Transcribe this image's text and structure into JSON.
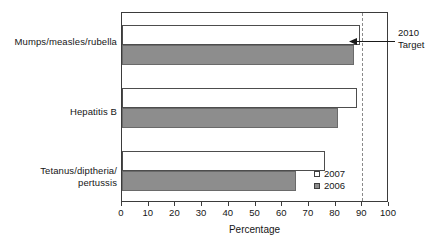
{
  "chart_data": {
    "type": "bar",
    "orientation": "horizontal",
    "title": "",
    "xlabel": "Percentage",
    "ylabel": "",
    "categories": [
      "Mumps/measles/rubella",
      "Hepatitis B",
      "Tetanus/diptheria/\npertussis"
    ],
    "series": [
      {
        "name": "2007",
        "values": [
          89,
          88,
          76
        ]
      },
      {
        "name": "2006",
        "values": [
          87,
          81,
          65
        ]
      }
    ],
    "xlim": [
      0,
      100
    ],
    "xticks": [
      0,
      10,
      20,
      30,
      40,
      50,
      60,
      70,
      80,
      90,
      100
    ],
    "xtick_labels": [
      "0",
      "10",
      "20",
      "30",
      "40",
      "50",
      "60",
      "70",
      "80",
      "90",
      "100"
    ],
    "grid": false,
    "legend_position": "inside-bottom-right",
    "legend_entries": [
      "2007",
      "2006"
    ],
    "annotations": [
      {
        "label": "2010\nTarget",
        "value": 90,
        "style": "dashed-vertical-line-with-arrow"
      }
    ],
    "colors": {
      "series_2007_fill": "#ffffff",
      "series_2007_border": "#4d4d4d",
      "series_2006_fill": "#8d8d8d",
      "series_2006_border": "#6a6a6a",
      "axis": "#3b3b3b",
      "target_line": "#8a8a8a",
      "text": "#161616"
    }
  },
  "axis": {
    "x_title": "Percentage"
  },
  "annotation": {
    "target_label": "2010\nTarget"
  },
  "legend": {
    "item_2007": "2007",
    "item_2006": "2006"
  },
  "categories": {
    "cat_0": "Mumps/measles/rubella",
    "cat_1": "Hepatitis B",
    "cat_2": "Tetanus/diptheria/\npertussis"
  },
  "xticks": {
    "t0": "0",
    "t1": "10",
    "t2": "20",
    "t3": "30",
    "t4": "40",
    "t5": "50",
    "t6": "60",
    "t7": "70",
    "t8": "80",
    "t9": "90",
    "t10": "100"
  }
}
